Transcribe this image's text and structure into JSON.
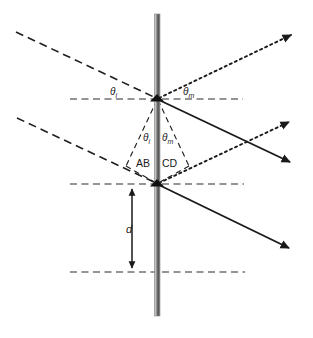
{
  "figure": {
    "colors": {
      "line": "#1a1a1a",
      "grating_light": "#b0b0b0",
      "grating_mid": "#6e6e6e",
      "grating_dark": "#4a4a4a",
      "background": "#ffffff"
    },
    "labels": {
      "theta_i_top": {
        "symbol": "θ",
        "subscript": "i",
        "x": 110,
        "y": 87
      },
      "theta_m_top": {
        "symbol": "θ",
        "subscript": "m",
        "x": 183,
        "y": 87
      },
      "theta_i_mid": {
        "symbol": "θ",
        "subscript": "i",
        "x": 143,
        "y": 133
      },
      "theta_m_mid": {
        "symbol": "θ",
        "subscript": "m",
        "x": 161,
        "y": 133
      },
      "segment_ab": {
        "text": "AB",
        "x": 137,
        "y": 159
      },
      "segment_cd": {
        "text": "CD",
        "x": 162,
        "y": 159
      },
      "spacing_d": {
        "text": "d",
        "x": 126,
        "y": 224
      }
    },
    "geometry": {
      "grating_x": 157,
      "grating_top": 14,
      "grating_bottom": 316,
      "vertex_top": {
        "x": 157,
        "y": 99
      },
      "vertex_bottom": {
        "x": 157,
        "y": 184
      },
      "axis_lines_y": [
        99,
        184,
        272
      ],
      "axis_x_start": 70,
      "axis_x_end": 245,
      "spacing_arrow": {
        "x": 132,
        "y_top": 185,
        "y_bottom": 272
      }
    },
    "rays": {
      "incident": [
        {
          "name": "incident-ray-upper",
          "style": "dashed",
          "from": [
            16,
            32
          ],
          "to": [
            157,
            99
          ]
        },
        {
          "name": "incident-ray-lower",
          "style": "dashed",
          "from": [
            17,
            118
          ],
          "to": [
            157,
            184
          ]
        }
      ],
      "diffracted_dotted": [
        {
          "name": "diffracted-ray-top",
          "style": "dotted",
          "from": [
            157,
            99
          ],
          "to": [
            293,
            34
          ]
        },
        {
          "name": "diffracted-ray-middle",
          "style": "dotted",
          "from": [
            157,
            184
          ],
          "to": [
            291,
            121
          ]
        }
      ],
      "transmitted_solid": [
        {
          "name": "transmitted-ray-top",
          "style": "solid",
          "from": [
            157,
            99
          ],
          "to": [
            292,
            163
          ]
        },
        {
          "name": "transmitted-ray-bottom",
          "style": "solid",
          "from": [
            157,
            184
          ],
          "to": [
            291,
            249
          ]
        }
      ],
      "construction": [
        {
          "name": "construction-line-ab",
          "style": "dashed",
          "from": [
            157,
            99
          ],
          "to": [
            127,
            165
          ]
        },
        {
          "name": "construction-line-ab-base",
          "style": "dashed",
          "from": [
            127,
            165
          ],
          "to": [
            157,
            184
          ]
        },
        {
          "name": "construction-line-cd",
          "style": "dashed",
          "from": [
            157,
            99
          ],
          "to": [
            188,
            165
          ]
        },
        {
          "name": "construction-line-cd-base",
          "style": "dashed",
          "from": [
            188,
            165
          ],
          "to": [
            157,
            184
          ]
        }
      ]
    }
  }
}
